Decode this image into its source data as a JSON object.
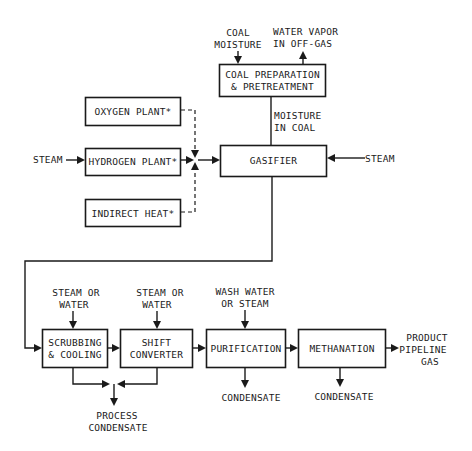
{
  "diagram": {
    "type": "process-flow",
    "colors": {
      "line": "#1a1a1a",
      "background": "#ffffff"
    },
    "nodes": {
      "coal_prep": {
        "lines": [
          "COAL PREPARATION",
          "& PRETREATMENT"
        ]
      },
      "oxygen_plant": {
        "lines": [
          "OXYGEN PLANT*"
        ]
      },
      "hydrogen_plant": {
        "lines": [
          "HYDROGEN PLANT*"
        ]
      },
      "indirect_heat": {
        "lines": [
          "INDIRECT HEAT*"
        ]
      },
      "gasifier": {
        "lines": [
          "GASIFIER"
        ]
      },
      "scrubbing": {
        "lines": [
          "SCRUBBING",
          "& COOLING"
        ]
      },
      "shift": {
        "lines": [
          "SHIFT",
          "CONVERTER"
        ]
      },
      "purification": {
        "lines": [
          "PURIFICATION"
        ]
      },
      "methanation": {
        "lines": [
          "METHANATION"
        ]
      }
    },
    "labels": {
      "coal_moisture": [
        "COAL",
        "MOISTURE"
      ],
      "water_vapor": [
        "WATER VAPOR",
        "IN OFF-GAS"
      ],
      "moisture_in_coal": [
        "MOISTURE",
        "IN COAL"
      ],
      "steam_left": [
        "STEAM"
      ],
      "steam_right": [
        "STEAM"
      ],
      "steam_or_water_1": [
        "STEAM OR",
        "WATER"
      ],
      "steam_or_water_2": [
        "STEAM OR",
        "WATER"
      ],
      "wash_water": [
        "WASH WATER",
        "OR STEAM"
      ],
      "product": [
        "PRODUCT",
        "PIPELINE",
        "GAS"
      ],
      "process_condensate": [
        "PROCESS",
        "CONDENSATE"
      ],
      "condensate_1": [
        "CONDENSATE"
      ],
      "condensate_2": [
        "CONDENSATE"
      ]
    },
    "edges": [
      {
        "from": "coal_moisture",
        "to": "coal_prep"
      },
      {
        "from": "coal_prep",
        "to": "water_vapor"
      },
      {
        "from": "coal_prep",
        "to": "gasifier",
        "label": "moisture_in_coal"
      },
      {
        "from": "steam_left",
        "to": "hydrogen_plant"
      },
      {
        "from": "oxygen_plant",
        "to": "gasifier",
        "style": "dashed"
      },
      {
        "from": "hydrogen_plant",
        "to": "gasifier"
      },
      {
        "from": "indirect_heat",
        "to": "gasifier",
        "style": "dashed"
      },
      {
        "from": "steam_right",
        "to": "gasifier"
      },
      {
        "from": "gasifier",
        "to": "scrubbing"
      },
      {
        "from": "steam_or_water_1",
        "to": "scrubbing"
      },
      {
        "from": "steam_or_water_2",
        "to": "shift"
      },
      {
        "from": "wash_water",
        "to": "purification"
      },
      {
        "from": "scrubbing",
        "to": "shift"
      },
      {
        "from": "shift",
        "to": "purification"
      },
      {
        "from": "purification",
        "to": "methanation"
      },
      {
        "from": "methanation",
        "to": "product"
      },
      {
        "from": "scrubbing",
        "to": "process_condensate"
      },
      {
        "from": "shift",
        "to": "process_condensate"
      },
      {
        "from": "purification",
        "to": "condensate_1"
      },
      {
        "from": "methanation",
        "to": "condensate_2"
      }
    ]
  }
}
